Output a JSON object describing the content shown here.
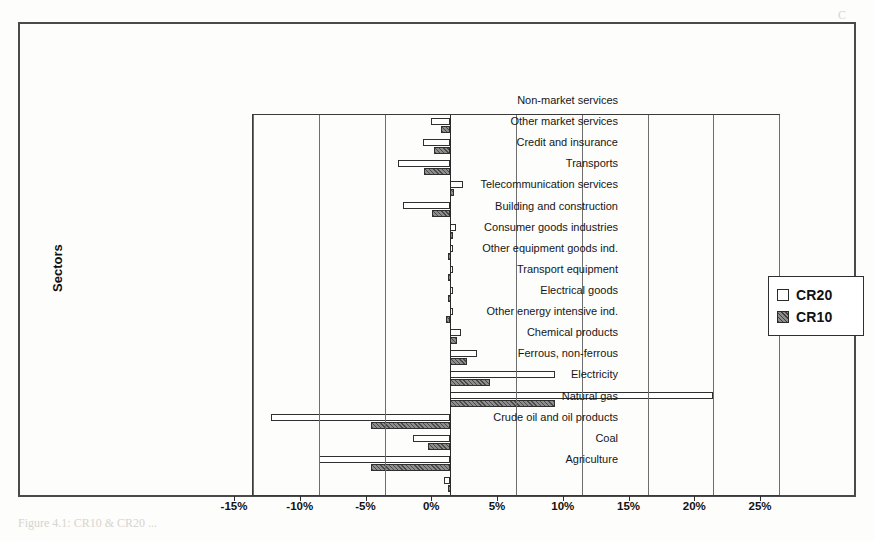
{
  "chart_data": {
    "type": "bar",
    "orientation": "horizontal",
    "title": "",
    "xlabel": "",
    "ylabel": "Sectors",
    "xlim": [
      -15,
      25
    ],
    "xticks": [
      "-15%",
      "-10%",
      "-5%",
      "0%",
      "5%",
      "10%",
      "15%",
      "20%",
      "25%"
    ],
    "xtick_values": [
      -15,
      -10,
      -5,
      0,
      5,
      10,
      15,
      20,
      25
    ],
    "grid": true,
    "grid_axis": "x",
    "legend_position": "right",
    "units": "percent",
    "categories": [
      "Non-market services",
      "Other market services",
      "Credit and insurance",
      "Transports",
      "Telecommunication services",
      "Building and construction",
      "Consumer goods industries",
      "Other equipment goods ind.",
      "Transport equipment",
      "Electrical goods",
      "Other energy intensive ind.",
      "Chemical products",
      "Ferrous, non-ferrous",
      "Electricity",
      "Natural gas",
      "Crude oil and oil products",
      "Coal",
      "Agriculture"
    ],
    "series": [
      {
        "name": "CR20",
        "color": "#ffffff",
        "values": [
          -1.5,
          -2.1,
          -4.0,
          1.0,
          -3.6,
          0.4,
          0.2,
          0.2,
          0.2,
          0.2,
          0.8,
          2.0,
          8.0,
          20.0,
          -13.6,
          -2.8,
          -10.0,
          -0.5
        ]
      },
      {
        "name": "CR10",
        "color": "#6d6d6d",
        "values": [
          -0.7,
          -1.2,
          -2.0,
          0.3,
          -1.4,
          0.1,
          -0.2,
          -0.2,
          -0.2,
          -0.3,
          0.5,
          1.3,
          3.0,
          8.0,
          -6.0,
          -1.7,
          -6.0,
          -0.2
        ]
      }
    ]
  },
  "legend": {
    "items": [
      {
        "label": "CR20",
        "swatch": "cr20"
      },
      {
        "label": "CR10",
        "swatch": "cr10"
      }
    ]
  },
  "axis": {
    "y_title": "Sectors"
  }
}
